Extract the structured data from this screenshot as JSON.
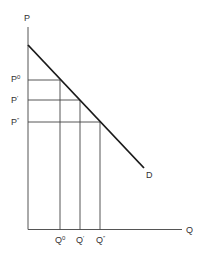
{
  "diagram": {
    "type": "demand-curve",
    "axes": {
      "y_label": "P",
      "x_label": "Q"
    },
    "curve_label": "D",
    "price_levels": [
      {
        "base": "P",
        "mark": "0"
      },
      {
        "base": "P",
        "mark": "′"
      },
      {
        "base": "P",
        "mark": "″"
      }
    ],
    "quantity_levels": [
      {
        "base": "Q",
        "mark": "0"
      },
      {
        "base": "Q",
        "mark": "′"
      },
      {
        "base": "Q",
        "mark": "″"
      }
    ],
    "colors": {
      "axis": "#555555",
      "curve": "#1a1a1a",
      "guide": "#444444",
      "text": "#333333"
    }
  }
}
